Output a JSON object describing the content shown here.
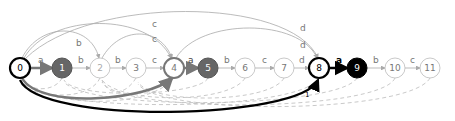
{
  "diagram": {
    "type": "automaton",
    "nodes": [
      {
        "id": "0",
        "label": "0",
        "x": 20,
        "style": "bold-outline"
      },
      {
        "id": "1",
        "label": "1",
        "x": 62,
        "style": "gray-fill"
      },
      {
        "id": "2",
        "label": "2",
        "x": 100,
        "style": "light"
      },
      {
        "id": "3",
        "label": "3",
        "x": 136,
        "style": "light"
      },
      {
        "id": "4",
        "label": "4",
        "x": 174,
        "style": "gray-outline"
      },
      {
        "id": "5",
        "label": "5",
        "x": 208,
        "style": "gray-fill"
      },
      {
        "id": "6",
        "label": "6",
        "x": 245,
        "style": "light"
      },
      {
        "id": "7",
        "label": "7",
        "x": 284,
        "style": "light"
      },
      {
        "id": "8",
        "label": "8",
        "x": 319,
        "style": "bold-outline"
      },
      {
        "id": "9",
        "label": "9",
        "x": 357,
        "style": "black-fill"
      },
      {
        "id": "10",
        "label": "10",
        "x": 395,
        "style": "light"
      },
      {
        "id": "11",
        "label": "11",
        "x": 430,
        "style": "light"
      }
    ],
    "chain_edges": [
      {
        "from": "0",
        "to": "1",
        "label": "a",
        "style": "gray-thick"
      },
      {
        "from": "1",
        "to": "2",
        "label": "b",
        "style": "light"
      },
      {
        "from": "2",
        "to": "3",
        "label": "b",
        "style": "light"
      },
      {
        "from": "3",
        "to": "4",
        "label": "c",
        "style": "light"
      },
      {
        "from": "4",
        "to": "5",
        "label": "a",
        "style": "gray-thick"
      },
      {
        "from": "5",
        "to": "6",
        "label": "b",
        "style": "light"
      },
      {
        "from": "6",
        "to": "7",
        "label": "c",
        "style": "light"
      },
      {
        "from": "7",
        "to": "8",
        "label": "d",
        "style": "light"
      },
      {
        "from": "8",
        "to": "9",
        "label": "a",
        "style": "black-thick",
        "sublabel": "1"
      },
      {
        "from": "9",
        "to": "10",
        "label": "b",
        "style": "light"
      },
      {
        "from": "10",
        "to": "11",
        "label": "c",
        "style": "light"
      }
    ],
    "top_arcs": [
      {
        "from": "0",
        "to": "2",
        "label": "b"
      },
      {
        "from": "0",
        "to": "4",
        "label": "c"
      },
      {
        "from": "2",
        "to": "4",
        "label": "c"
      },
      {
        "from": "0",
        "to": "8",
        "label": "d"
      },
      {
        "from": "4",
        "to": "8",
        "label": "d"
      }
    ],
    "bottom_arcs": [
      {
        "from": "0",
        "to": "4",
        "style": "gray-thick"
      },
      {
        "from": "0",
        "to": "8",
        "style": "black-thick",
        "label": "1"
      }
    ],
    "failure_links": [
      "1",
      "2",
      "3",
      "4",
      "5",
      "6",
      "7",
      "8",
      "9",
      "10",
      "11"
    ],
    "colors": {
      "light": "#aaaaaa",
      "gray": "#777777",
      "black": "#000000",
      "dashed": "#bbbbbb"
    }
  }
}
